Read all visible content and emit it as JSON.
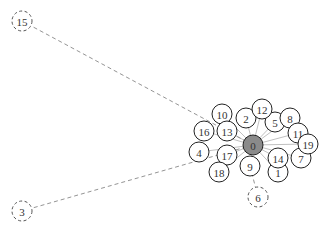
{
  "diagram": {
    "type": "network-graph",
    "colors": {
      "node_stroke": "#222222",
      "node_fill": "#ffffff",
      "center_fill": "#8a8a8a",
      "edge_solid": "#b0b0b0",
      "edge_dashed": "#888888",
      "label": "#333333"
    },
    "nodes": [
      {
        "id": "0",
        "label": "0",
        "x": 253,
        "y": 145,
        "r": 10,
        "style": "center"
      },
      {
        "id": "1",
        "label": "1",
        "x": 278,
        "y": 172,
        "r": 10,
        "style": "solid"
      },
      {
        "id": "2",
        "label": "2",
        "x": 246,
        "y": 118,
        "r": 10,
        "style": "solid"
      },
      {
        "id": "3",
        "label": "3",
        "x": 22,
        "y": 211,
        "r": 10,
        "style": "dashed"
      },
      {
        "id": "4",
        "label": "4",
        "x": 199,
        "y": 152,
        "r": 10,
        "style": "solid"
      },
      {
        "id": "5",
        "label": "5",
        "x": 275,
        "y": 122,
        "r": 10,
        "style": "solid"
      },
      {
        "id": "6",
        "label": "6",
        "x": 258,
        "y": 197,
        "r": 10,
        "style": "dashed"
      },
      {
        "id": "7",
        "label": "7",
        "x": 301,
        "y": 158,
        "r": 10,
        "style": "solid"
      },
      {
        "id": "8",
        "label": "8",
        "x": 290,
        "y": 118,
        "r": 10,
        "style": "solid"
      },
      {
        "id": "9",
        "label": "9",
        "x": 250,
        "y": 166,
        "r": 10,
        "style": "solid"
      },
      {
        "id": "10",
        "label": "10",
        "x": 222,
        "y": 114,
        "r": 10,
        "style": "solid"
      },
      {
        "id": "11",
        "label": "11",
        "x": 298,
        "y": 133,
        "r": 10,
        "style": "solid"
      },
      {
        "id": "12",
        "label": "12",
        "x": 262,
        "y": 109,
        "r": 10,
        "style": "solid"
      },
      {
        "id": "13",
        "label": "13",
        "x": 227,
        "y": 131,
        "r": 10,
        "style": "solid"
      },
      {
        "id": "14",
        "label": "14",
        "x": 278,
        "y": 158,
        "r": 10,
        "style": "solid"
      },
      {
        "id": "15",
        "label": "15",
        "x": 22,
        "y": 21,
        "r": 10,
        "style": "dashed"
      },
      {
        "id": "16",
        "label": "16",
        "x": 204,
        "y": 131,
        "r": 10,
        "style": "solid"
      },
      {
        "id": "17",
        "label": "17",
        "x": 227,
        "y": 155,
        "r": 10,
        "style": "solid"
      },
      {
        "id": "18",
        "label": "18",
        "x": 219,
        "y": 172,
        "r": 10,
        "style": "solid"
      },
      {
        "id": "19",
        "label": "19",
        "x": 308,
        "y": 144,
        "r": 10,
        "style": "solid"
      }
    ],
    "edges": [
      {
        "from": "0",
        "to": "1",
        "style": "solid"
      },
      {
        "from": "0",
        "to": "2",
        "style": "solid"
      },
      {
        "from": "0",
        "to": "4",
        "style": "solid"
      },
      {
        "from": "0",
        "to": "5",
        "style": "solid"
      },
      {
        "from": "0",
        "to": "7",
        "style": "solid"
      },
      {
        "from": "0",
        "to": "8",
        "style": "solid"
      },
      {
        "from": "0",
        "to": "9",
        "style": "solid"
      },
      {
        "from": "0",
        "to": "10",
        "style": "solid"
      },
      {
        "from": "0",
        "to": "11",
        "style": "solid"
      },
      {
        "from": "0",
        "to": "12",
        "style": "solid"
      },
      {
        "from": "0",
        "to": "13",
        "style": "solid"
      },
      {
        "from": "0",
        "to": "14",
        "style": "solid"
      },
      {
        "from": "0",
        "to": "16",
        "style": "solid"
      },
      {
        "from": "0",
        "to": "17",
        "style": "solid"
      },
      {
        "from": "0",
        "to": "18",
        "style": "solid"
      },
      {
        "from": "0",
        "to": "19",
        "style": "solid"
      },
      {
        "from": "0",
        "to": "15",
        "style": "dashed"
      },
      {
        "from": "0",
        "to": "3",
        "style": "dashed"
      },
      {
        "from": "9",
        "to": "6",
        "style": "dashed"
      }
    ]
  }
}
